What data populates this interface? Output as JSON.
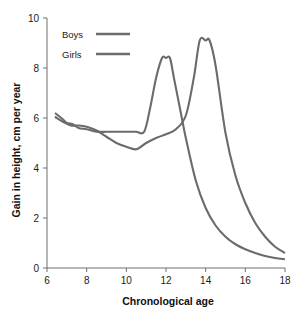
{
  "chart_data": {
    "type": "line",
    "title": "",
    "xlabel": "Chronological age",
    "ylabel": "Gain in height, cm per year",
    "xlim": [
      6,
      18
    ],
    "ylim": [
      0,
      10
    ],
    "xticks": [
      6,
      8,
      10,
      12,
      14,
      16,
      18
    ],
    "yticks": [
      0,
      2,
      4,
      6,
      8,
      10
    ],
    "xtick_labels": [
      "6",
      "8",
      "10",
      "12",
      "14",
      "16",
      "18"
    ],
    "ytick_labels": [
      "0",
      "2",
      "4",
      "6",
      "8",
      "10"
    ],
    "grid": false,
    "legend_position": "upper-left",
    "series": [
      {
        "name": "Boys",
        "color": "#6b6b6b",
        "x": [
          6.4,
          6.8,
          7.2,
          7.6,
          8.0,
          8.5,
          9.0,
          9.5,
          10.0,
          10.5,
          11.0,
          11.5,
          12.0,
          12.5,
          13.0,
          13.4,
          13.7,
          14.0,
          14.2,
          14.5,
          15.0,
          15.5,
          16.0,
          16.5,
          17.0,
          17.5,
          18.0
        ],
        "y": [
          6.05,
          5.85,
          5.7,
          5.7,
          5.65,
          5.5,
          5.25,
          5.0,
          4.85,
          4.75,
          5.0,
          5.2,
          5.35,
          5.55,
          6.1,
          7.6,
          9.1,
          9.1,
          9.1,
          8.1,
          5.4,
          3.7,
          2.6,
          1.8,
          1.25,
          0.85,
          0.6
        ]
      },
      {
        "name": "Girls",
        "color": "#6b6b6b",
        "x": [
          6.4,
          6.8,
          7.0,
          7.3,
          7.6,
          8.0,
          8.5,
          9.0,
          9.5,
          10.0,
          10.5,
          10.9,
          11.2,
          11.5,
          11.8,
          12.0,
          12.2,
          12.4,
          12.7,
          13.0,
          13.5,
          14.0,
          14.5,
          15.0,
          15.5,
          16.0,
          16.5,
          17.0,
          17.5,
          18.0
        ],
        "y": [
          6.2,
          5.95,
          5.8,
          5.75,
          5.6,
          5.55,
          5.45,
          5.45,
          5.45,
          5.45,
          5.45,
          5.45,
          6.4,
          7.6,
          8.4,
          8.4,
          8.4,
          7.6,
          6.4,
          5.2,
          3.5,
          2.4,
          1.7,
          1.25,
          0.95,
          0.75,
          0.6,
          0.48,
          0.4,
          0.35
        ]
      }
    ],
    "legend": [
      {
        "label": "Boys",
        "color": "#6b6b6b"
      },
      {
        "label": "Girls",
        "color": "#6b6b6b"
      }
    ],
    "colors": {
      "line": "#6b6b6b",
      "axis": "#6e6e6e",
      "text": "#1a1a1a",
      "background": "#ffffff"
    }
  }
}
